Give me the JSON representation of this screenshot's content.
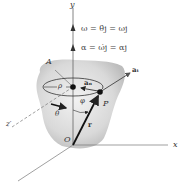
{
  "diagram": {
    "equations": {
      "omega": "ω = θ̇j = ωj",
      "alpha": "α = ω̇j = αj"
    },
    "labels": {
      "y_axis": "y",
      "x_axis": "x",
      "z_axis": "z′",
      "point_A": "A",
      "point_P": "P",
      "origin": "O",
      "rho": "ρ",
      "a_n": "aₙ",
      "a_t": "aₜ",
      "phi": "φ",
      "theta": "θ",
      "r": "r"
    },
    "colors": {
      "body_fill": "#d6d6d6",
      "line": "#555555",
      "axis": "#777777",
      "dark": "#111111"
    }
  }
}
